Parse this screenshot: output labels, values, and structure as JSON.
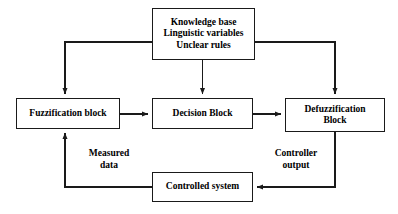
{
  "diagram": {
    "background_color": "#ffffff",
    "line_color": "#1a1a1a",
    "text_color": "#000000",
    "nodes": {
      "knowledge": {
        "label": "Knowledge base\nLinguistic variables\nUnclear rules",
        "lines": [
          "Knowledge base",
          "Linguistic variables",
          "Unclear rules"
        ]
      },
      "fuzzify": {
        "label": "Fuzzification block",
        "lines": [
          "Fuzzification block"
        ]
      },
      "decision": {
        "label": "Decision Block",
        "lines": [
          "Decision Block"
        ]
      },
      "defuzzify": {
        "label": "Defuzzification\nBlock",
        "lines": [
          "Defuzzification",
          "Block"
        ]
      },
      "plant": {
        "label": "Controlled system",
        "lines": [
          "Controlled system"
        ]
      }
    },
    "edge_labels": {
      "measured_data": "Measured\ndata",
      "controller_output": "Controller\noutput"
    },
    "connections": [
      {
        "from": "knowledge",
        "to": "fuzzify",
        "style": "elbow-left-down",
        "arrow": true
      },
      {
        "from": "knowledge",
        "to": "decision",
        "style": "straight-down",
        "arrow": true
      },
      {
        "from": "knowledge",
        "to": "defuzzify",
        "style": "elbow-right-down",
        "arrow": true
      },
      {
        "from": "fuzzify",
        "to": "decision",
        "style": "straight-right",
        "arrow": true
      },
      {
        "from": "decision",
        "to": "defuzzify",
        "style": "straight-right",
        "arrow": true
      },
      {
        "from": "defuzzify",
        "to": "plant",
        "style": "elbow-down-left",
        "arrow": true,
        "label": "controller_output"
      },
      {
        "from": "plant",
        "to": "fuzzify",
        "style": "elbow-left-up",
        "arrow": true,
        "label": "measured_data"
      }
    ]
  }
}
